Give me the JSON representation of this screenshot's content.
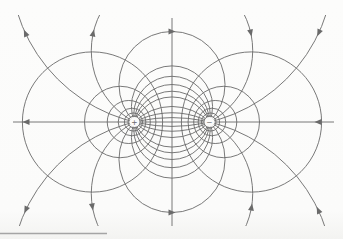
{
  "figure": {
    "kind": "electric-dipole-field-and-equipotential-diagram",
    "line_color": "#6a6a6a",
    "rule_color": "#a5a5a5",
    "background": "#fbfbfa"
  },
  "geometry": {
    "width": 343,
    "height": 239,
    "axis_y": 122,
    "center_x": 172,
    "charge_half_separation": 37.5,
    "clip": {
      "x1": 12,
      "y1": 15,
      "x2": 333,
      "y2": 226
    },
    "axis_line": {
      "x1": 13,
      "x2": 334
    },
    "zero_potential_line": {
      "y1": 18,
      "y2": 226
    },
    "stroke_width": 0.9
  },
  "charges": [
    {
      "label": "+",
      "x": 134.5,
      "y": 122,
      "marker_radius": 5
    },
    {
      "label": "−",
      "x": 209.5,
      "y": 122,
      "marker_radius": 5
    }
  ],
  "field_lines": {
    "circle_multipliers": [
      4.2,
      1.906,
      1,
      0.4142,
      0.199,
      0,
      -0.199,
      -0.4142,
      -1,
      -1.906,
      -4.2
    ]
  },
  "equipotentials": {
    "lambdas": [
      1.669,
      2.5,
      3.75,
      5.6,
      8.4,
      12.6,
      18.9
    ]
  },
  "arrows": {
    "size": 7,
    "items": [
      {
        "type": "axis",
        "x": 26
      },
      {
        "type": "axis",
        "x": 318
      },
      {
        "type": "y",
        "m": 4.2,
        "y": 33,
        "branch": -1
      },
      {
        "type": "y",
        "m": 4.2,
        "y": 33,
        "branch": 1
      },
      {
        "type": "y",
        "m": 1.906,
        "y": 33,
        "branch": -1
      },
      {
        "type": "y",
        "m": 1.906,
        "y": 33,
        "branch": 1
      },
      {
        "type": "y",
        "m": -1.906,
        "y": 207,
        "branch": -1
      },
      {
        "type": "y",
        "m": -1.906,
        "y": 207,
        "branch": 1
      },
      {
        "type": "y",
        "m": -4.2,
        "y": 210,
        "branch": -1
      },
      {
        "type": "y",
        "m": -4.2,
        "y": 210,
        "branch": 1
      },
      {
        "type": "apex",
        "m": 1
      },
      {
        "type": "apex",
        "m": -1
      }
    ]
  },
  "page_rule": {
    "x1": 0,
    "x2": 107,
    "y": 233.5
  }
}
